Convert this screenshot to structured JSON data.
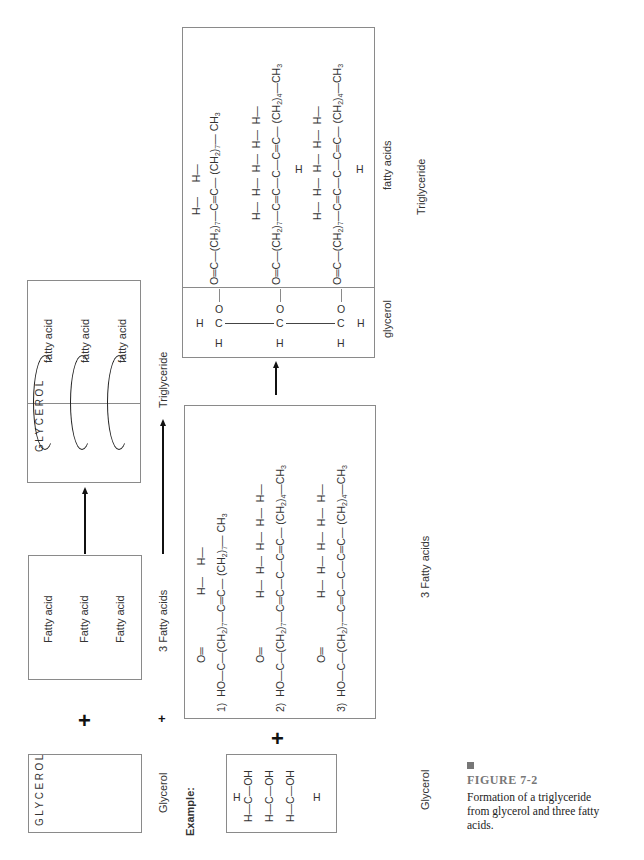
{
  "figure": {
    "number": "FIGURE   7-2",
    "caption_lines": [
      "Formation of a triglyceride",
      "from glycerol and three fatty",
      "acids."
    ],
    "accent_color": "#777777"
  },
  "schematic": {
    "glycerol_letters": "GLYCEROL",
    "glycerol_label": "Glycerol",
    "fatty_acid_items": [
      "Fatty acid",
      "Fatty acid",
      "Fatty acid"
    ],
    "fatty_acids_label": "3 Fatty acids",
    "product_letters": "GLYCEROL",
    "product_fatty_acid_items": [
      "fatty acid",
      "fatty acid",
      "fatty acid"
    ],
    "product_label": "Triglyceride",
    "plus_symbol": "+"
  },
  "example": {
    "heading": "Example:",
    "glycerol_label": "Glycerol",
    "fatty_acids_label": "3 Fatty acids",
    "glycerol_rows": [
      {
        "left": "H",
        "center": "C",
        "right": "OH",
        "top": "H"
      },
      {
        "left": "H",
        "center": "C",
        "right": "OH"
      },
      {
        "left": "H",
        "center": "C",
        "right": "OH",
        "bottom": "H"
      }
    ],
    "fatty_acids": [
      {
        "num": "1)",
        "head": "HO—C",
        "carbonyl": "O",
        "chain": "(CH2)7—C=C—(CH2)7—CH3",
        "h_count": 2
      },
      {
        "num": "2)",
        "head": "HO—C",
        "carbonyl": "O",
        "chain": "(CH2)7—C=C—C—C=C—(CH2)4—CH3",
        "h_count": 5
      },
      {
        "num": "3)",
        "head": "HO—C",
        "carbonyl": "O",
        "chain": "(CH2)7—C=C—C—C=C—(CH2)4—CH3",
        "h_count": 5
      }
    ],
    "triglyceride": {
      "glycerol_label": "glycerol",
      "fatty_acids_label": "fatty acids",
      "product_label": "Triglyceride"
    },
    "text": {
      "H": "H",
      "C": "C",
      "O": "O",
      "OH": "OH",
      "HO": "HO",
      "ch2_7": "(CH",
      "ch2_4": "(CH",
      "sub2": "2",
      "sub7": "7",
      "sub4": "4",
      "sub3": "3",
      "ch3": "CH",
      "paren": ")"
    }
  }
}
